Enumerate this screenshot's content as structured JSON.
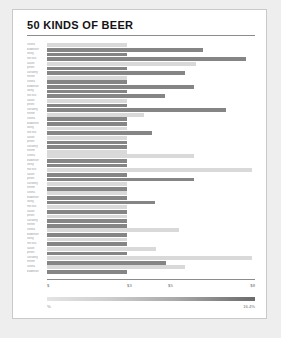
{
  "page": {
    "background_color": "#eeeeee",
    "card_color": "#ffffff",
    "card_border_color": "#c9c9c9"
  },
  "header": {
    "title": "50 KINDS OF BEER"
  },
  "legend": {
    "min_label": "%",
    "max_label": "16.4%",
    "gradient_from": "#e4e4e4",
    "gradient_to": "#6b6b6b"
  },
  "colors": {
    "bar_dark": "#858585",
    "bar_light": "#d9d9d9",
    "axis": "#8c8c8c",
    "label_text": "#9a9a9a",
    "tick_text": "#6f6f6f",
    "title_text": "#141414"
  },
  "chart_data": {
    "type": "bar",
    "orientation": "horizontal",
    "title": "50 KINDS OF BEER",
    "xlabel": "",
    "ylabel": "",
    "xlim": [
      0,
      9
    ],
    "grid": false,
    "legend_position": "bottom",
    "axis_ticks": [
      {
        "label": "$",
        "value": 0,
        "pos_pct": 0
      },
      {
        "label": "$3",
        "value": 3,
        "pos_pct": 38.5
      },
      {
        "label": "$5",
        "value": 5,
        "pos_pct": 58.2
      },
      {
        "label": "$8",
        "value": 8,
        "pos_pct": 98.5
      }
    ],
    "categories": [
      "corona",
      "budweiser",
      "viking",
      "red rock",
      "saison",
      "peroni",
      "carlsberg",
      "heinne",
      "corona",
      "budweiser",
      "viking",
      "red rock",
      "saison",
      "peroni",
      "carlsberg",
      "heinne",
      "corona",
      "budweiser",
      "viking",
      "red rock",
      "saison",
      "peroni",
      "carlsberg",
      "heinne",
      "corona",
      "budweiser",
      "viking",
      "red rock",
      "saison",
      "peroni",
      "carlsberg",
      "heinne",
      "corona",
      "budweiser",
      "viking",
      "red rock",
      "saison",
      "peroni",
      "carlsberg",
      "heinne",
      "corona",
      "budweiser",
      "viking",
      "red rock",
      "saison",
      "peroni",
      "carlsberg",
      "heinne",
      "corona",
      "budweiser"
    ],
    "values": [
      38.5,
      75.0,
      38.5,
      95.5,
      71.5,
      38.5,
      66.5,
      38.5,
      38.5,
      70.5,
      38.5,
      56.5,
      38.5,
      38.5,
      86.0,
      46.5,
      38.5,
      38.5,
      38.5,
      50.5,
      38.5,
      38.5,
      38.5,
      38.5,
      70.5,
      38.5,
      38.5,
      98.5,
      38.5,
      70.5,
      38.5,
      38.5,
      38.5,
      38.5,
      52.0,
      38.5,
      38.5,
      38.5,
      38.5,
      38.5,
      63.5,
      38.5,
      38.5,
      38.5,
      52.5,
      38.5,
      98.5,
      57.0,
      66.5,
      38.5
    ],
    "shades": [
      "light",
      "dark",
      "dark",
      "dark",
      "light",
      "dark",
      "dark",
      "light",
      "dark",
      "dark",
      "dark",
      "dark",
      "light",
      "dark",
      "dark",
      "light",
      "dark",
      "dark",
      "light",
      "dark",
      "light",
      "dark",
      "dark",
      "light",
      "light",
      "dark",
      "dark",
      "light",
      "dark",
      "dark",
      "light",
      "dark",
      "light",
      "dark",
      "dark",
      "light",
      "dark",
      "light",
      "dark",
      "dark",
      "light",
      "dark",
      "light",
      "dark",
      "light",
      "dark",
      "light",
      "dark",
      "light",
      "dark"
    ]
  }
}
